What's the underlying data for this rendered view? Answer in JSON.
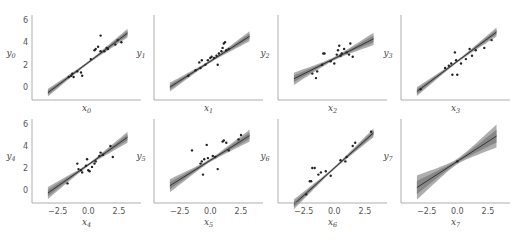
{
  "chart_data": {
    "type": "scatter",
    "title": "",
    "layout": {
      "rows": 2,
      "cols": 4,
      "sharex": true,
      "sharey": true,
      "grid": false
    },
    "xlim": [
      -4.6,
      4.3
    ],
    "ylim": [
      -1.2,
      7.4
    ],
    "xticks": [
      -2.5,
      0.0,
      2.5
    ],
    "xtick_labels": [
      "−2.5",
      "0.0",
      "2.5"
    ],
    "yticks": [
      0,
      2,
      4,
      6
    ],
    "ytick_labels": [
      "0",
      "2",
      "4",
      "6"
    ],
    "colors": {
      "points": "#222222",
      "line": "#333333",
      "band_outer": "#a0a0a0",
      "band_inner": "#7a7a7a",
      "axis": "#999999"
    },
    "panels": [
      {
        "xlabel": "x",
        "xsub": "0",
        "ylabel": "y",
        "ysub": "0",
        "line": {
          "intercept": 2.2,
          "slope": 0.82,
          "x0": -3.3,
          "x1": 3.2
        },
        "band_halfwidth": [
          0.35,
          0.12,
          0.4
        ],
        "points": [
          [
            -1.6,
            0.9
          ],
          [
            -1.4,
            1.0
          ],
          [
            -1.3,
            1.2
          ],
          [
            -1.2,
            0.9
          ],
          [
            -0.9,
            1.4
          ],
          [
            -0.6,
            1.3
          ],
          [
            -0.5,
            1.0
          ],
          [
            0.2,
            2.5
          ],
          [
            0.5,
            3.3
          ],
          [
            0.6,
            3.4
          ],
          [
            0.8,
            3.6
          ],
          [
            1.0,
            3.2
          ],
          [
            1.0,
            4.6
          ],
          [
            1.3,
            3.2
          ],
          [
            1.5,
            3.5
          ],
          [
            1.6,
            3.4
          ],
          [
            2.2,
            3.8
          ],
          [
            2.4,
            4.2
          ],
          [
            2.7,
            4.0
          ]
        ]
      },
      {
        "xlabel": "x",
        "xsub": "1",
        "ylabel": "y",
        "ysub": "1",
        "line": {
          "intercept": 2.3,
          "slope": 0.7,
          "x0": -3.3,
          "x1": 3.2
        },
        "band_halfwidth": [
          0.4,
          0.12,
          0.45
        ],
        "points": [
          [
            -1.8,
            1.0
          ],
          [
            -1.2,
            1.5
          ],
          [
            -0.9,
            2.2
          ],
          [
            -0.8,
            1.7
          ],
          [
            -0.7,
            2.4
          ],
          [
            -0.4,
            2.0
          ],
          [
            -0.2,
            2.4
          ],
          [
            0.0,
            2.6
          ],
          [
            0.1,
            2.7
          ],
          [
            0.3,
            2.6
          ],
          [
            0.5,
            2.8
          ],
          [
            0.6,
            2.0
          ],
          [
            0.7,
            3.0
          ],
          [
            0.9,
            3.2
          ],
          [
            1.0,
            3.5
          ],
          [
            1.1,
            3.9
          ],
          [
            1.2,
            4.0
          ],
          [
            1.3,
            3.3
          ],
          [
            1.5,
            3.4
          ]
        ]
      },
      {
        "xlabel": "x",
        "xsub": "2",
        "ylabel": "y",
        "ysub": "2",
        "line": {
          "intercept": 2.55,
          "slope": 0.55,
          "x0": -3.3,
          "x1": 3.2
        },
        "band_halfwidth": [
          0.55,
          0.15,
          0.55
        ],
        "points": [
          [
            -1.8,
            1.2
          ],
          [
            -1.5,
            0.8
          ],
          [
            -1.4,
            1.4
          ],
          [
            -1.0,
            2.0
          ],
          [
            -0.9,
            3.0
          ],
          [
            -0.8,
            3.0
          ],
          [
            -0.3,
            2.3
          ],
          [
            0.0,
            2.1
          ],
          [
            0.2,
            2.9
          ],
          [
            0.3,
            3.3
          ],
          [
            0.4,
            3.7
          ],
          [
            0.5,
            2.8
          ],
          [
            0.6,
            3.0
          ],
          [
            0.8,
            3.4
          ],
          [
            1.0,
            3.1
          ],
          [
            1.2,
            2.9
          ],
          [
            1.3,
            3.9
          ],
          [
            1.5,
            2.7
          ]
        ]
      },
      {
        "xlabel": "x",
        "xsub": "3",
        "ylabel": "y",
        "ysub": "3",
        "line": {
          "intercept": 2.3,
          "slope": 0.82,
          "x0": -3.3,
          "x1": 3.2
        },
        "band_halfwidth": [
          0.4,
          0.12,
          0.4
        ],
        "points": [
          [
            -3.0,
            -0.2
          ],
          [
            -1.0,
            1.7
          ],
          [
            -0.7,
            1.9
          ],
          [
            -0.5,
            2.1
          ],
          [
            -0.4,
            1.1
          ],
          [
            -0.2,
            3.1
          ],
          [
            -0.1,
            2.4
          ],
          [
            0.0,
            1.1
          ],
          [
            0.3,
            2.1
          ],
          [
            0.7,
            2.5
          ],
          [
            1.0,
            3.4
          ],
          [
            1.2,
            2.8
          ],
          [
            1.5,
            3.3
          ],
          [
            2.2,
            3.5
          ],
          [
            2.8,
            4.2
          ]
        ]
      },
      {
        "xlabel": "x",
        "xsub": "4",
        "ylabel": "y",
        "ysub": "4",
        "line": {
          "intercept": 2.3,
          "slope": 0.78,
          "x0": -3.3,
          "x1": 3.2
        },
        "band_halfwidth": [
          0.55,
          0.12,
          0.5
        ],
        "points": [
          [
            -1.7,
            0.6
          ],
          [
            -0.9,
            2.4
          ],
          [
            -0.8,
            1.9
          ],
          [
            -0.6,
            1.8
          ],
          [
            -0.5,
            1.6
          ],
          [
            -0.2,
            2.2
          ],
          [
            -0.1,
            2.8
          ],
          [
            0.0,
            1.8
          ],
          [
            0.1,
            1.7
          ],
          [
            0.3,
            2.1
          ],
          [
            0.5,
            2.4
          ],
          [
            0.6,
            2.6
          ],
          [
            0.9,
            3.1
          ],
          [
            1.0,
            3.4
          ],
          [
            1.2,
            3.2
          ],
          [
            1.8,
            4.0
          ],
          [
            2.0,
            3.0
          ]
        ]
      },
      {
        "xlabel": "x",
        "xsub": "5",
        "ylabel": "y",
        "ysub": "5",
        "line": {
          "intercept": 2.7,
          "slope": 0.7,
          "x0": -3.3,
          "x1": 3.2
        },
        "band_halfwidth": [
          0.6,
          0.15,
          0.55
        ],
        "points": [
          [
            -1.5,
            3.6
          ],
          [
            -0.8,
            2.4
          ],
          [
            -0.7,
            2.6
          ],
          [
            -0.6,
            1.4
          ],
          [
            -0.5,
            2.8
          ],
          [
            -0.3,
            4.1
          ],
          [
            -0.2,
            2.9
          ],
          [
            0.2,
            3.1
          ],
          [
            0.4,
            3.0
          ],
          [
            0.6,
            1.9
          ],
          [
            1.0,
            4.4
          ],
          [
            1.1,
            4.5
          ],
          [
            1.3,
            4.3
          ],
          [
            1.5,
            3.6
          ],
          [
            2.3,
            4.6
          ],
          [
            2.5,
            5.0
          ]
        ]
      },
      {
        "xlabel": "x",
        "xsub": "6",
        "ylabel": "y",
        "ysub": "6",
        "line": {
          "intercept": 2.0,
          "slope": 1.0,
          "x0": -3.3,
          "x1": 3.2
        },
        "band_halfwidth": [
          0.45,
          0.12,
          0.4
        ],
        "points": [
          [
            -2.3,
            -0.4
          ],
          [
            -2.0,
            0.8
          ],
          [
            -1.9,
            0.8
          ],
          [
            -1.8,
            2.0
          ],
          [
            -1.6,
            2.0
          ],
          [
            -1.3,
            1.4
          ],
          [
            -1.1,
            1.6
          ],
          [
            -0.7,
            1.7
          ],
          [
            -0.3,
            1.3
          ],
          [
            0.5,
            2.7
          ],
          [
            0.9,
            2.6
          ],
          [
            1.0,
            3.0
          ],
          [
            1.5,
            4.0
          ],
          [
            1.7,
            4.3
          ],
          [
            3.0,
            5.3
          ]
        ]
      },
      {
        "xlabel": "x",
        "xsub": "7",
        "ylabel": "y",
        "ysub": "7",
        "line": {
          "intercept": 2.6,
          "slope": 0.72,
          "x0": -3.3,
          "x1": 3.2
        },
        "band_halfwidth": [
          1.1,
          0.25,
          1.05
        ],
        "points": [
          [
            0.0,
            2.6
          ]
        ]
      }
    ]
  }
}
